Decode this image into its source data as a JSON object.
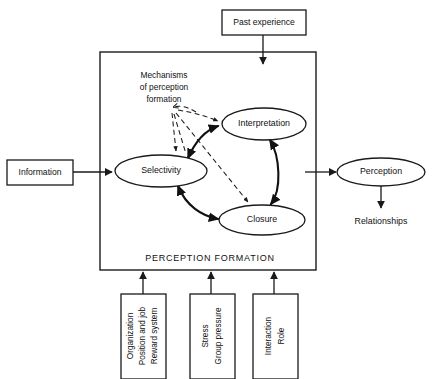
{
  "diagram": {
    "title": "Perception Formation",
    "container_caption": "PERCEPTION FORMATION",
    "annotation": {
      "line1": "Mechanisms",
      "line2": "of perception",
      "line3": "formation"
    },
    "inputs": {
      "top": {
        "label": "Past experience"
      },
      "left": {
        "label": "Information"
      }
    },
    "outputs": {
      "primary": {
        "label": "Perception"
      },
      "secondary": {
        "label": "Relationships"
      }
    },
    "core_nodes": [
      {
        "id": "selectivity",
        "label": "Selectivity"
      },
      {
        "id": "interpretation",
        "label": "Interpretation"
      },
      {
        "id": "closure",
        "label": "Closure"
      }
    ],
    "influence_boxes": [
      {
        "id": "organization",
        "lines": [
          "Organization",
          "Position and job",
          "Reward system"
        ]
      },
      {
        "id": "stress",
        "lines": [
          "Stress",
          "Group pressure"
        ]
      },
      {
        "id": "interaction",
        "lines": [
          "Interaction",
          "Role"
        ]
      }
    ],
    "colors": {
      "stroke": "#1a1a1a",
      "fill": "#ffffff",
      "text": "#111111"
    }
  }
}
